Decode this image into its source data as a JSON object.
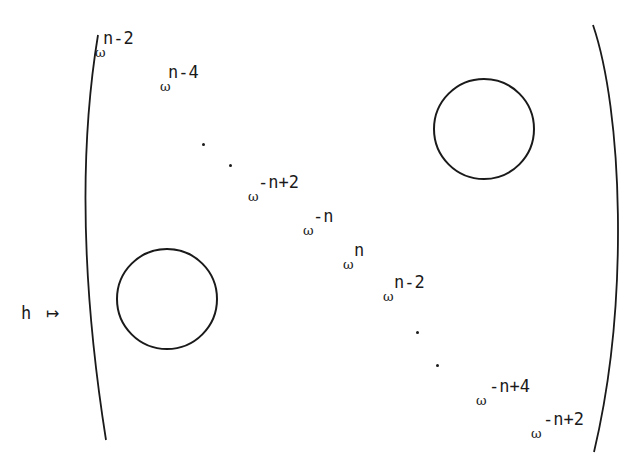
{
  "figure": {
    "map_label": "h",
    "maps_to_symbol": "↦",
    "diagonal_entries": [
      {
        "base": "ω",
        "exponent": "n-2",
        "x": 95,
        "y": 30
      },
      {
        "base": "ω",
        "exponent": "n-4",
        "x": 160,
        "y": 64
      },
      {
        "base": "ω",
        "exponent": "-n+2",
        "x": 248,
        "y": 174
      },
      {
        "base": "ω",
        "exponent": "-n",
        "x": 303,
        "y": 208
      },
      {
        "base": "ω",
        "exponent": "n",
        "x": 343,
        "y": 242
      },
      {
        "base": "ω",
        "exponent": "n-2",
        "x": 383,
        "y": 274
      },
      {
        "base": "ω",
        "exponent": "-n+4",
        "x": 476,
        "y": 378
      },
      {
        "base": "ω",
        "exponent": "-n+2",
        "x": 531,
        "y": 411
      }
    ],
    "ellipsis_dots": [
      {
        "x": 202,
        "y": 143
      },
      {
        "x": 229,
        "y": 164
      },
      {
        "x": 416,
        "y": 331
      },
      {
        "x": 436,
        "y": 364
      }
    ],
    "zero_blocks": [
      {
        "position": "upper-right",
        "cx": 484,
        "cy": 129,
        "r": 50
      },
      {
        "position": "lower-left",
        "cx": 167,
        "cy": 299,
        "r": 50
      }
    ],
    "colors": {
      "ink": "#1a1a1a",
      "background": "#ffffff"
    }
  }
}
